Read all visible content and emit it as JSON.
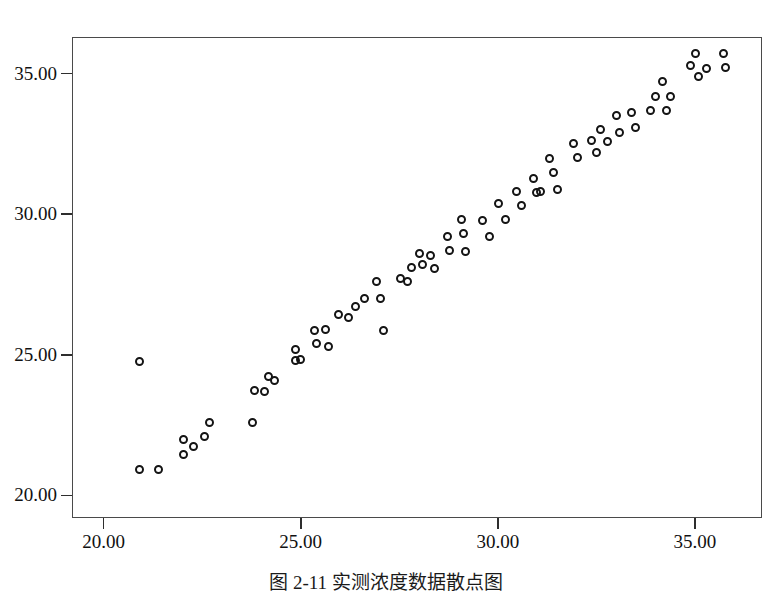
{
  "figure": {
    "caption": "图 2-11  实测浓度数据散点图",
    "frame_color": "#4a4a4a",
    "marker_color": "#141414",
    "background": "#ffffff"
  },
  "chart_data": {
    "type": "scatter",
    "title": "",
    "xlabel": "",
    "ylabel": "",
    "xlim": [
      19.2,
      36.7
    ],
    "ylim": [
      19.2,
      36.3
    ],
    "xticks": [
      20.0,
      25.0,
      30.0,
      35.0
    ],
    "yticks": [
      20.0,
      25.0,
      30.0,
      35.0
    ],
    "xticklabels": [
      "20.00",
      "25.00",
      "30.00",
      "35.00"
    ],
    "yticklabels": [
      "20.00",
      "25.00",
      "30.00",
      "35.00"
    ],
    "grid": false,
    "legend": false,
    "marker": "open-circle",
    "series": [
      {
        "name": "observations",
        "points": [
          [
            20.91,
            24.78
          ],
          [
            20.91,
            20.92
          ],
          [
            21.39,
            20.92
          ],
          [
            22.02,
            21.45
          ],
          [
            22.03,
            22.0
          ],
          [
            22.28,
            21.73
          ],
          [
            22.55,
            22.1
          ],
          [
            22.68,
            22.6
          ],
          [
            23.78,
            22.6
          ],
          [
            23.82,
            23.72
          ],
          [
            24.08,
            23.7
          ],
          [
            24.18,
            24.22
          ],
          [
            24.34,
            24.08
          ],
          [
            24.86,
            25.2
          ],
          [
            24.88,
            24.8
          ],
          [
            25.0,
            24.85
          ],
          [
            25.36,
            25.85
          ],
          [
            25.4,
            25.42
          ],
          [
            25.62,
            25.9
          ],
          [
            25.7,
            25.28
          ],
          [
            25.95,
            26.45
          ],
          [
            26.2,
            26.32
          ],
          [
            26.4,
            26.72
          ],
          [
            26.62,
            27.0
          ],
          [
            26.92,
            27.6
          ],
          [
            27.02,
            27.02
          ],
          [
            27.1,
            25.88
          ],
          [
            27.52,
            27.72
          ],
          [
            27.7,
            27.6
          ],
          [
            27.8,
            28.1
          ],
          [
            28.02,
            28.62
          ],
          [
            28.08,
            28.2
          ],
          [
            28.3,
            28.52
          ],
          [
            28.4,
            28.08
          ],
          [
            28.72,
            29.22
          ],
          [
            28.78,
            28.7
          ],
          [
            29.08,
            29.8
          ],
          [
            29.12,
            29.3
          ],
          [
            29.18,
            28.68
          ],
          [
            29.6,
            29.78
          ],
          [
            29.78,
            29.22
          ],
          [
            30.02,
            30.38
          ],
          [
            30.2,
            29.8
          ],
          [
            30.48,
            30.8
          ],
          [
            30.6,
            30.3
          ],
          [
            30.9,
            31.28
          ],
          [
            30.98,
            30.78
          ],
          [
            31.08,
            30.82
          ],
          [
            31.3,
            31.98
          ],
          [
            31.4,
            31.5
          ],
          [
            31.52,
            30.88
          ],
          [
            31.92,
            32.5
          ],
          [
            32.02,
            32.02
          ],
          [
            32.38,
            32.62
          ],
          [
            32.5,
            32.18
          ],
          [
            32.6,
            33.02
          ],
          [
            32.78,
            32.58
          ],
          [
            33.0,
            33.5
          ],
          [
            33.08,
            32.9
          ],
          [
            33.4,
            33.6
          ],
          [
            33.5,
            33.08
          ],
          [
            33.88,
            33.7
          ],
          [
            34.0,
            34.2
          ],
          [
            34.18,
            34.72
          ],
          [
            34.28,
            33.7
          ],
          [
            34.38,
            34.18
          ],
          [
            34.88,
            35.28
          ],
          [
            35.02,
            35.7
          ],
          [
            35.1,
            34.9
          ],
          [
            35.3,
            35.18
          ],
          [
            35.72,
            35.72
          ],
          [
            35.78,
            35.2
          ]
        ]
      }
    ]
  }
}
